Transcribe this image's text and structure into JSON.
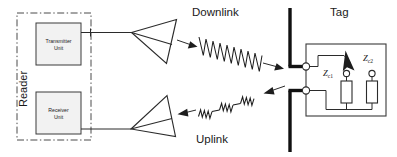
{
  "diagram": {
    "labels": {
      "reader": "Reader",
      "transmitter_unit": "Transmitter\nUnit",
      "transmitter_unit_line1": "Transmitter",
      "transmitter_unit_line2": "Unit",
      "receiver_unit_line1": "Receiver",
      "receiver_unit_line2": "Unit",
      "downlink": "Downlink",
      "uplink": "Uplink",
      "tag": "Tag",
      "impedance_1": "Z",
      "impedance_1_sub": "c1",
      "impedance_2": "Z",
      "impedance_2_sub": "c2"
    },
    "colors": {
      "line": "#2b2b2b",
      "dipole": "#111111",
      "dashed_border": "#4a4a4a",
      "unit_fill": "#f2f2f2",
      "background": "#ffffff",
      "text": "#1a1a1a"
    },
    "components": {
      "reader_enclosure": "dash-dot rectangle",
      "transmit_antenna": "horn-antenna-transmit",
      "receive_antenna": "horn-antenna-receive",
      "tag_antenna": "dipole-antenna",
      "switch": "modulation-switch",
      "downlink_wave": "continuous-carrier-wave",
      "uplink_wave": "modulated-backscatter-wave"
    }
  }
}
